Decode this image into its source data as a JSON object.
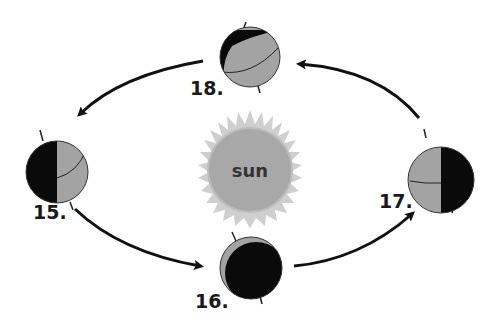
{
  "diagram": {
    "sun": {
      "label": "sun",
      "color": "#a8a8a8",
      "ray_color": "#cfcfcf"
    },
    "colors": {
      "lit": "#a3a3a3",
      "dark": "#0a0a0a",
      "arrow": "#111111",
      "outline": "#333333"
    },
    "positions": [
      {
        "id": "18",
        "label": "18.",
        "location": "top"
      },
      {
        "id": "15",
        "label": "15.",
        "location": "left"
      },
      {
        "id": "16",
        "label": "16.",
        "location": "bottom"
      },
      {
        "id": "17",
        "label": "17.",
        "location": "right"
      }
    ],
    "arrows": [
      {
        "from": "17",
        "to": "18",
        "direction": "counterclockwise"
      },
      {
        "from": "18",
        "to": "15",
        "direction": "counterclockwise"
      },
      {
        "from": "15",
        "to": "16",
        "direction": "counterclockwise"
      },
      {
        "from": "16",
        "to": "17",
        "direction": "counterclockwise"
      }
    ]
  }
}
